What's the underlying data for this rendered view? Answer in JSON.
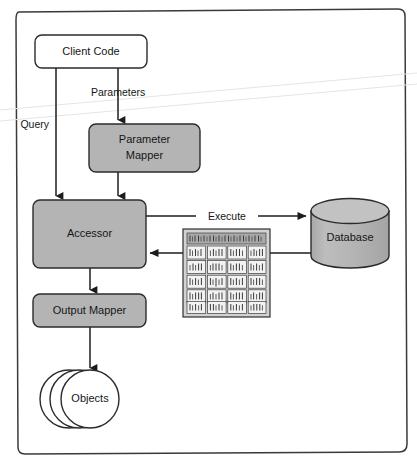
{
  "diagram": {
    "frame": {
      "present": true,
      "shape": "rounded-rectangle"
    },
    "colors": {
      "node_fill_gray": "#b4b4b4",
      "node_fill_white": "#ffffff",
      "stroke": "#2b2b2b",
      "text": "#161616",
      "recordset_header": "#a9a9a9",
      "recordset_cell": "#f2f2f2",
      "scanline": "#e4e4e4"
    },
    "nodes": [
      {
        "id": "client_code",
        "label": "Client Code",
        "shape": "rounded-rect",
        "fill": "white"
      },
      {
        "id": "parameter_mapper",
        "label_line1": "Parameter",
        "label_line2": "Mapper",
        "shape": "rounded-rect",
        "fill": "gray"
      },
      {
        "id": "accessor",
        "label": "Accessor",
        "shape": "rounded-rect",
        "fill": "gray"
      },
      {
        "id": "output_mapper",
        "label": "Output Mapper",
        "shape": "rounded-rect",
        "fill": "gray"
      },
      {
        "id": "database",
        "label": "Database",
        "shape": "cylinder",
        "fill": "gray"
      },
      {
        "id": "objects",
        "label": "Objects",
        "shape": "stacked-circles",
        "fill": "white",
        "count": 3
      },
      {
        "id": "record_set",
        "label": "",
        "shape": "grid-table",
        "rows": 5,
        "columns": 4,
        "header_row": true
      }
    ],
    "edges": [
      {
        "id": "query",
        "label": "Query",
        "from": "client_code",
        "to": "accessor",
        "direction": "down"
      },
      {
        "id": "parameters",
        "label": "Parameters",
        "from": "client_code",
        "to": "parameter_mapper",
        "direction": "down"
      },
      {
        "id": "mapper_to_accessor",
        "label": "",
        "from": "parameter_mapper",
        "to": "accessor",
        "direction": "down"
      },
      {
        "id": "execute",
        "label": "Execute",
        "from": "accessor",
        "to": "database",
        "direction": "right"
      },
      {
        "id": "result_set",
        "label": "",
        "from": "database",
        "to": "accessor",
        "direction": "left"
      },
      {
        "id": "accessor_to_output",
        "label": "",
        "from": "accessor",
        "to": "output_mapper",
        "direction": "down"
      },
      {
        "id": "output_to_objects",
        "label": "",
        "from": "output_mapper",
        "to": "objects",
        "direction": "down"
      }
    ]
  }
}
